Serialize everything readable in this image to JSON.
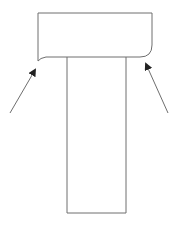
{
  "diagram": {
    "colors": {
      "stroke": "#6e6e6e",
      "background": "#ffffff"
    },
    "cap": {
      "x": 38,
      "y": 13,
      "width": 114,
      "height": 44,
      "left_bottom_corner": "notched",
      "right_bottom_corner": "rounded"
    },
    "stem": {
      "x": 67,
      "y": 57,
      "width": 59,
      "height": 156
    },
    "arrows": [
      {
        "id": "left",
        "from": [
          10,
          113
        ],
        "to": [
          35,
          70
        ]
      },
      {
        "id": "right",
        "from": [
          168,
          113
        ],
        "to": [
          146,
          64
        ]
      }
    ]
  }
}
